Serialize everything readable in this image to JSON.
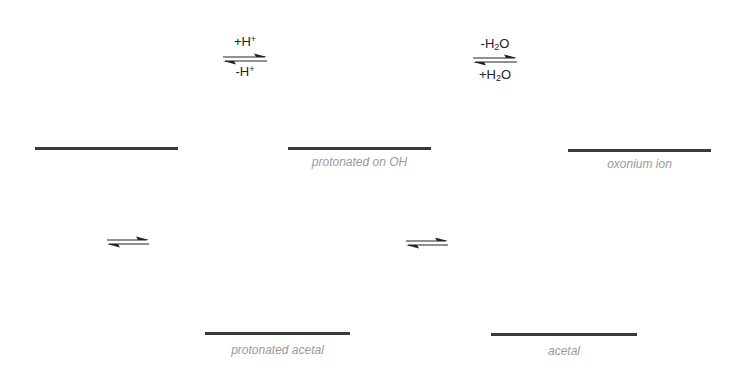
{
  "scheme": {
    "species": [
      {
        "id": "hemiacetal",
        "label": "",
        "x": 35,
        "y": 147,
        "width": 143
      },
      {
        "id": "protonated-oh",
        "label": "protonated on OH",
        "x": 288,
        "y": 147,
        "width": 143
      },
      {
        "id": "oxonium",
        "label": "oxonium ion",
        "x": 568,
        "y": 149,
        "width": 143
      },
      {
        "id": "protonated-acetal",
        "label": "protonated acetal",
        "x": 205,
        "y": 332,
        "width": 145
      },
      {
        "id": "acetal",
        "label": "acetal",
        "x": 491,
        "y": 333,
        "width": 146
      }
    ],
    "equilibria": [
      {
        "id": "eq1",
        "forward": "+H+",
        "reverse": "-H+",
        "x": 224,
        "y": 56
      },
      {
        "id": "eq2",
        "forward": "-H2O",
        "reverse": "+H2O",
        "x": 472,
        "y": 56
      },
      {
        "id": "eq3",
        "forward": "",
        "reverse": "",
        "x": 106,
        "y": 239
      },
      {
        "id": "eq4",
        "forward": "",
        "reverse": "",
        "x": 405,
        "y": 241
      }
    ],
    "conditions": {
      "eq1_top_main": "+H",
      "eq1_top_sup": "+",
      "eq1_bottom_main": "-H",
      "eq1_bottom_sup": "+",
      "eq2_top_a": "-H",
      "eq2_top_sub": "2",
      "eq2_top_b": "O",
      "eq2_bottom_a": "+H",
      "eq2_bottom_sub": "2",
      "eq2_bottom_b": "O"
    },
    "colors": {
      "line": "#3a3a3a",
      "label": "#9a9a9a",
      "text": "#222222"
    }
  }
}
